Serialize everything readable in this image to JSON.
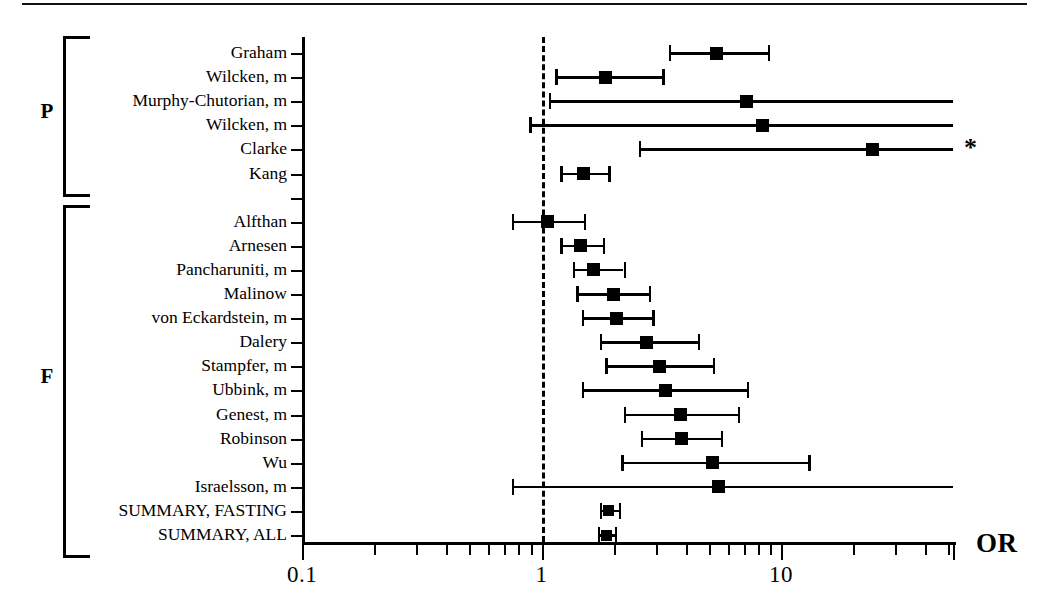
{
  "figure": {
    "axis_title": "OR",
    "footnote_marker": "*",
    "groups": [
      {
        "letter": "P",
        "name": "post-methionine-load"
      },
      {
        "letter": "F",
        "name": "fasting"
      }
    ]
  },
  "chart_data": {
    "type": "scatter",
    "title": "",
    "xlabel": "OR",
    "ylabel": "",
    "xscale": "log",
    "xlim": [
      0.1,
      60
    ],
    "xticks": [
      0.1,
      1,
      10
    ],
    "xticklabels": [
      "0.1",
      "1",
      "10"
    ],
    "grid": false,
    "legend": "none",
    "reference_line": 1,
    "annotations": [
      {
        "text": "*",
        "row": "Clarke",
        "meaning": "confidence interval extends beyond axis"
      }
    ],
    "series": [
      {
        "name": "P",
        "group_label": "P",
        "points": [
          {
            "label": "Graham",
            "or": 5.4,
            "ci_low": 3.4,
            "ci_high": 8.8,
            "truncated_right": false,
            "truncated_left": false
          },
          {
            "label": "Wilcken, m",
            "or": 1.85,
            "ci_low": 1.14,
            "ci_high": 3.2,
            "truncated_right": false,
            "truncated_left": false
          },
          {
            "label": "Murphy-Chutorian, m",
            "or": 7.2,
            "ci_low": 1.07,
            "ci_high": 60,
            "truncated_right": true,
            "truncated_left": false
          },
          {
            "label": "Wilcken, m",
            "or": 8.4,
            "ci_low": 0.89,
            "ci_high": 60,
            "truncated_right": true,
            "truncated_left": false
          },
          {
            "label": "Clarke",
            "or": 24.0,
            "ci_low": 2.55,
            "ci_high": 55,
            "truncated_right": true,
            "truncated_left": false
          },
          {
            "label": "Kang",
            "or": 1.5,
            "ci_low": 1.2,
            "ci_high": 1.9,
            "truncated_right": false,
            "truncated_left": false
          }
        ]
      },
      {
        "name": "F",
        "group_label": "F",
        "points": [
          {
            "label": "Alfthan",
            "or": 1.06,
            "ci_low": 0.75,
            "ci_high": 1.5,
            "truncated_right": false,
            "truncated_left": false
          },
          {
            "label": "Arnesen",
            "or": 1.45,
            "ci_low": 1.2,
            "ci_high": 1.8,
            "truncated_right": false,
            "truncated_left": false
          },
          {
            "label": "Pancharuniti, m",
            "or": 1.65,
            "ci_low": 1.35,
            "ci_high": 2.2,
            "truncated_right": false,
            "truncated_left": false
          },
          {
            "label": "Malinow",
            "or": 2.0,
            "ci_low": 1.4,
            "ci_high": 2.8,
            "truncated_right": false,
            "truncated_left": false
          },
          {
            "label": "von Eckardstein, m",
            "or": 2.05,
            "ci_low": 1.47,
            "ci_high": 2.9,
            "truncated_right": false,
            "truncated_left": false
          },
          {
            "label": "Dalery",
            "or": 2.75,
            "ci_low": 1.75,
            "ci_high": 4.5,
            "truncated_right": false,
            "truncated_left": false
          },
          {
            "label": "Stampfer, m",
            "or": 3.1,
            "ci_low": 1.85,
            "ci_high": 5.2,
            "truncated_right": false,
            "truncated_left": false
          },
          {
            "label": "Ubbink, m",
            "or": 3.3,
            "ci_low": 1.47,
            "ci_high": 7.2,
            "truncated_right": false,
            "truncated_left": false
          },
          {
            "label": "Genest, m",
            "or": 3.8,
            "ci_low": 2.2,
            "ci_high": 6.6,
            "truncated_right": false,
            "truncated_left": false
          },
          {
            "label": "Robinson",
            "or": 3.85,
            "ci_low": 2.6,
            "ci_high": 5.6,
            "truncated_right": false,
            "truncated_left": false
          },
          {
            "label": "Wu",
            "or": 5.2,
            "ci_low": 2.15,
            "ci_high": 13.0,
            "truncated_right": false,
            "truncated_left": false
          },
          {
            "label": "Israelsson, m",
            "or": 5.5,
            "ci_low": 0.75,
            "ci_high": 60,
            "truncated_right": true,
            "truncated_left": false
          },
          {
            "label": "SUMMARY, FASTING",
            "or": 1.9,
            "ci_low": 1.75,
            "ci_high": 2.1,
            "truncated_right": false,
            "truncated_left": false
          },
          {
            "label": "SUMMARY, ALL",
            "or": 1.86,
            "ci_low": 1.72,
            "ci_high": 2.02,
            "truncated_right": false,
            "truncated_left": false
          }
        ]
      }
    ]
  }
}
